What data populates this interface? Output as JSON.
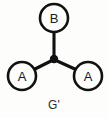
{
  "figure": {
    "caption": "G'",
    "background_color": "#fdfdfc",
    "stroke_color": "#111111",
    "text_color": "#1a1a1a"
  },
  "graph": {
    "type": "undirected-tree",
    "junction": {
      "name": "center-junction",
      "x": 54,
      "y": 59,
      "radius": 4.2,
      "filled": true
    },
    "nodes": [
      {
        "id": "node-b",
        "label": "B",
        "x": 54,
        "y": 18,
        "radius": 14,
        "position": "top"
      },
      {
        "id": "node-a-left",
        "label": "A",
        "x": 22,
        "y": 76,
        "radius": 14,
        "position": "bottom-left"
      },
      {
        "id": "node-a-right",
        "label": "A",
        "x": 88,
        "y": 76,
        "radius": 14,
        "position": "bottom-right"
      }
    ],
    "edges": [
      {
        "id": "edge-junction-b",
        "from": "center-junction",
        "to": "node-b",
        "x1": 54,
        "y1": 58,
        "x2": 54,
        "y2": 32
      },
      {
        "id": "edge-junction-a-left",
        "from": "center-junction",
        "to": "node-a-left",
        "x1": 53,
        "y1": 60,
        "x2": 33,
        "y2": 70
      },
      {
        "id": "edge-junction-a-right",
        "from": "center-junction",
        "to": "node-a-right",
        "x1": 55,
        "y1": 60,
        "x2": 77,
        "y2": 70
      }
    ]
  },
  "caption": {
    "text": "G'",
    "x": 54,
    "y": 105
  }
}
